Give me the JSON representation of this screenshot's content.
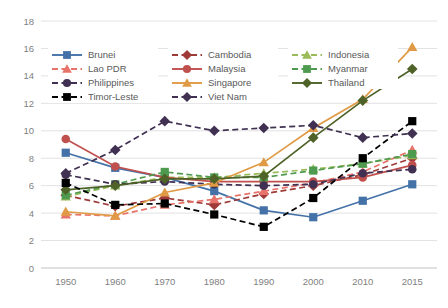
{
  "chart_data": {
    "type": "line",
    "title": "",
    "xlabel": "",
    "ylabel": "",
    "grid": true,
    "legend_position": "top-inside",
    "categories": [
      "1950",
      "1960",
      "1970",
      "1980",
      "1990",
      "2000",
      "2010",
      "2015"
    ],
    "xticklabels": [
      "1950",
      "1960",
      "1970",
      "1980",
      "1990",
      "2000",
      "2010",
      "2015"
    ],
    "yticklabels": [
      "0",
      "2",
      "4",
      "6",
      "8",
      "10",
      "12",
      "14",
      "16",
      "18"
    ],
    "yticks": [
      0,
      2,
      4,
      6,
      8,
      10,
      12,
      14,
      16,
      18
    ],
    "ylim": [
      0,
      18
    ],
    "series": [
      {
        "name": "Brunei",
        "color": "#4472a8",
        "dash": "solid",
        "marker": "square",
        "values": [
          8.4,
          7.3,
          6.6,
          5.6,
          4.2,
          3.7,
          4.9,
          6.1
        ]
      },
      {
        "name": "Cambodia",
        "color": "#9e3a38",
        "dash": "dashed",
        "marker": "diamond",
        "values": [
          5.3,
          4.5,
          5.1,
          4.6,
          5.4,
          6.0,
          6.8,
          8.0
        ]
      },
      {
        "name": "Indonesia",
        "color": "#9bbb59",
        "dash": "dashed",
        "marker": "triangle",
        "values": [
          5.2,
          6.0,
          6.6,
          6.6,
          6.9,
          7.2,
          7.6,
          8.2
        ]
      },
      {
        "name": "Lao PDR",
        "color": "#e8736a",
        "dash": "dashed",
        "marker": "triangle",
        "values": [
          3.9,
          3.8,
          4.6,
          5.0,
          5.6,
          6.2,
          7.0,
          8.6
        ]
      },
      {
        "name": "Malaysia",
        "color": "#c0504d",
        "dash": "solid",
        "marker": "circle",
        "values": [
          9.4,
          7.4,
          6.6,
          6.3,
          6.3,
          6.3,
          6.6,
          7.5
        ]
      },
      {
        "name": "Myanmar",
        "color": "#4e9a4e",
        "dash": "dashed",
        "marker": "square",
        "values": [
          5.3,
          6.1,
          7.0,
          6.6,
          6.6,
          7.1,
          7.6,
          8.3
        ]
      },
      {
        "name": "Philippines",
        "color": "#403152",
        "dash": "dashed",
        "marker": "circle",
        "values": [
          6.8,
          6.1,
          6.3,
          6.1,
          6.0,
          6.1,
          6.9,
          7.2
        ]
      },
      {
        "name": "Singapore",
        "color": "#e09a45",
        "dash": "solid",
        "marker": "triangle",
        "values": [
          4.1,
          3.8,
          5.5,
          6.2,
          7.7,
          10.2,
          12.3,
          16.1
        ]
      },
      {
        "name": "Thailand",
        "color": "#4f6228",
        "dash": "solid",
        "marker": "diamond",
        "values": [
          5.7,
          6.0,
          6.5,
          6.5,
          6.7,
          9.5,
          12.2,
          14.5
        ]
      },
      {
        "name": "Timor-Leste",
        "color": "#000000",
        "dash": "dashed",
        "marker": "square",
        "values": [
          6.2,
          4.6,
          4.7,
          3.9,
          3.0,
          5.1,
          8.0,
          10.7
        ]
      },
      {
        "name": "Viet Nam",
        "color": "#403152",
        "dash": "dashed",
        "marker": "diamond",
        "values": [
          6.9,
          8.6,
          10.7,
          10.0,
          10.2,
          10.4,
          9.5,
          9.8
        ]
      }
    ]
  },
  "legend": {
    "entries": [
      {
        "label": "Brunei"
      },
      {
        "label": "Cambodia"
      },
      {
        "label": "Indonesia"
      },
      {
        "label": "Lao PDR"
      },
      {
        "label": "Malaysia"
      },
      {
        "label": "Myanmar"
      },
      {
        "label": "Philippines"
      },
      {
        "label": "Singapore"
      },
      {
        "label": "Thailand"
      },
      {
        "label": "Timor-Leste"
      },
      {
        "label": "Viet Nam"
      }
    ]
  }
}
